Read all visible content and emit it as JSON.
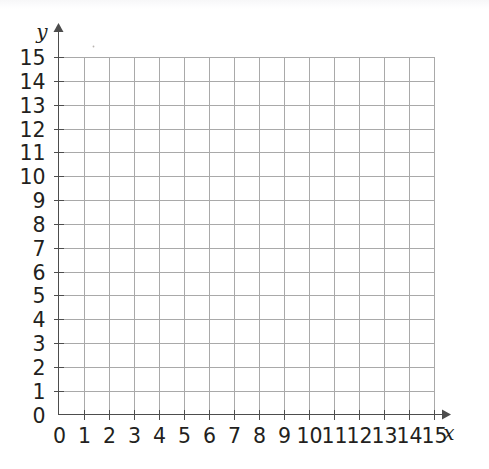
{
  "figure": {
    "name": "coordinate-grid",
    "background_color": "#ffffff",
    "grid_color": "#a9a9a9",
    "axis_color": "#4d4d4d",
    "label_color": "#231f20"
  },
  "chart_data": {
    "type": "scatter",
    "title": "",
    "xlabel": "x",
    "ylabel": "y",
    "x": [],
    "y": [],
    "series": [],
    "xlim": [
      0,
      15
    ],
    "ylim": [
      0,
      15
    ],
    "xticks": [
      0,
      1,
      2,
      3,
      4,
      5,
      6,
      7,
      8,
      9,
      10,
      11,
      12,
      13,
      14,
      15
    ],
    "yticks": [
      0,
      1,
      2,
      3,
      4,
      5,
      6,
      7,
      8,
      9,
      10,
      11,
      12,
      13,
      14,
      15
    ],
    "xtick_labels": [
      "0",
      "1",
      "2",
      "3",
      "4",
      "5",
      "6",
      "7",
      "8",
      "9",
      "10",
      "11",
      "12",
      "13",
      "14",
      "15"
    ],
    "ytick_labels": [
      "0",
      "1",
      "2",
      "3",
      "4",
      "5",
      "6",
      "7",
      "8",
      "9",
      "10",
      "11",
      "12",
      "13",
      "14",
      "15"
    ],
    "grid": true,
    "grid_step": 1,
    "legend": null,
    "legend_position": "none",
    "annotations": [],
    "axis_arrows": true
  },
  "axes": {
    "x_label": "x",
    "y_label": "y"
  }
}
